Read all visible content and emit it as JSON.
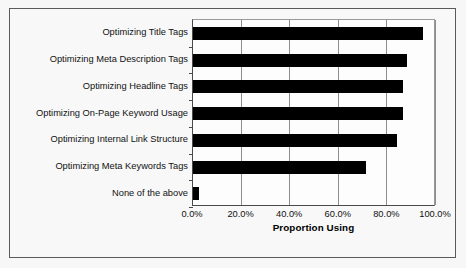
{
  "chart_data": {
    "type": "bar",
    "orientation": "horizontal",
    "title": "",
    "xlabel": "Proportion Using",
    "ylabel": "",
    "xlim": [
      0,
      100
    ],
    "xtick_labels": [
      "0.0%",
      "20.0%",
      "40.0%",
      "60.0%",
      "80.0%",
      "100.0%"
    ],
    "xtick_values": [
      0,
      20,
      40,
      60,
      80,
      100
    ],
    "grid": true,
    "legend": false,
    "bar_color": "#000000",
    "plot_background": "#fdfdfd",
    "categories": [
      "Optimizing Title Tags",
      "Optimizing Meta Description Tags",
      "Optimizing Headline Tags",
      "Optimizing On-Page Keyword Usage",
      "Optimizing Internal Link Structure",
      "Optimizing Meta Keywords Tags",
      "None of the above"
    ],
    "values": [
      94.5,
      88.0,
      86.5,
      86.5,
      84.0,
      71.0,
      2.5
    ],
    "value_unit": "%"
  }
}
